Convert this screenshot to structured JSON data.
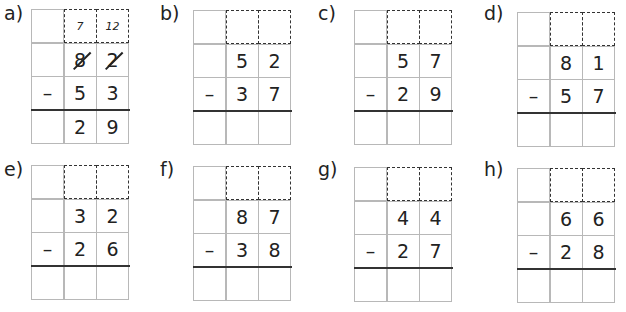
{
  "problems": [
    {
      "label": "a)",
      "carry": [
        "7",
        "12"
      ],
      "top": [
        "8",
        "2"
      ],
      "operator": "–",
      "bottom": [
        "5",
        "3"
      ],
      "answer": [
        "2",
        "9"
      ],
      "struck": true
    },
    {
      "label": "b)",
      "carry": [
        "",
        ""
      ],
      "top": [
        "5",
        "2"
      ],
      "operator": "–",
      "bottom": [
        "3",
        "7"
      ],
      "answer": [
        "",
        ""
      ]
    },
    {
      "label": "c)",
      "carry": [
        "",
        ""
      ],
      "top": [
        "5",
        "7"
      ],
      "operator": "–",
      "bottom": [
        "2",
        "9"
      ],
      "answer": [
        "",
        ""
      ]
    },
    {
      "label": "d)",
      "carry": [
        "",
        ""
      ],
      "top": [
        "8",
        "1"
      ],
      "operator": "–",
      "bottom": [
        "5",
        "7"
      ],
      "answer": [
        "",
        ""
      ]
    },
    {
      "label": "e)",
      "carry": [
        "",
        ""
      ],
      "top": [
        "3",
        "2"
      ],
      "operator": "–",
      "bottom": [
        "2",
        "6"
      ],
      "answer": [
        "",
        ""
      ]
    },
    {
      "label": "f)",
      "carry": [
        "",
        ""
      ],
      "top": [
        "8",
        "7"
      ],
      "operator": "–",
      "bottom": [
        "3",
        "8"
      ],
      "answer": [
        "",
        ""
      ]
    },
    {
      "label": "g)",
      "carry": [
        "",
        ""
      ],
      "top": [
        "4",
        "4"
      ],
      "operator": "–",
      "bottom": [
        "2",
        "7"
      ],
      "answer": [
        "",
        ""
      ]
    },
    {
      "label": "h)",
      "carry": [
        "",
        ""
      ],
      "top": [
        "6",
        "6"
      ],
      "operator": "–",
      "bottom": [
        "2",
        "8"
      ],
      "answer": [
        "",
        ""
      ]
    }
  ]
}
